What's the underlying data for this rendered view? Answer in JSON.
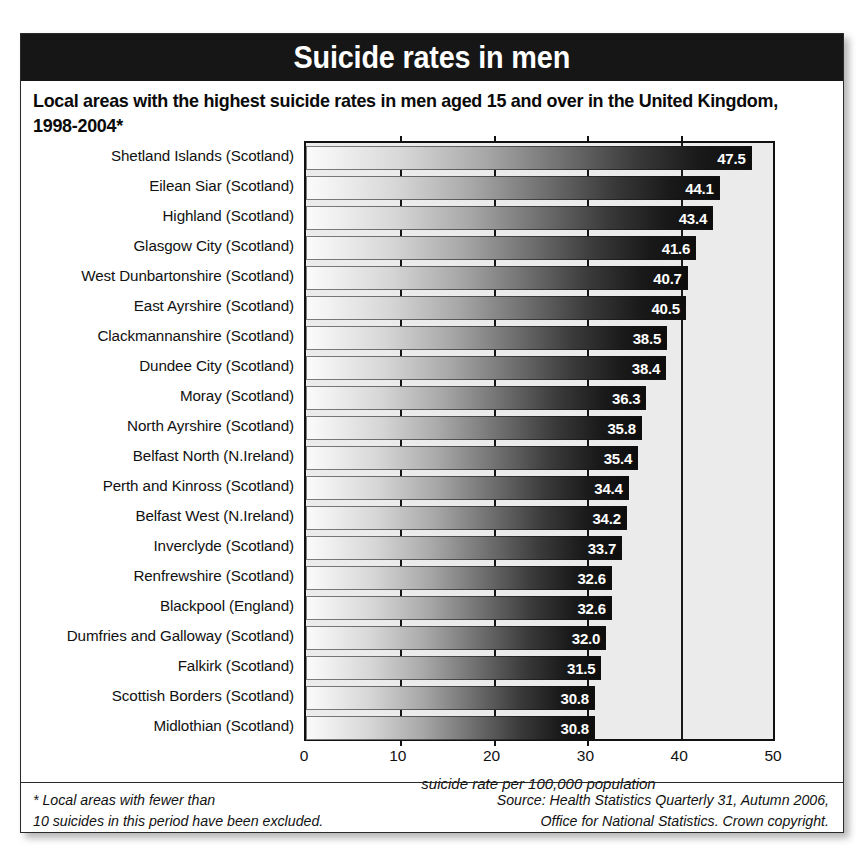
{
  "header": {
    "title": "Suicide rates in men",
    "subtitle": "Local areas with the highest suicide rates in men aged 15 and over in the United Kingdom, 1998-2004*"
  },
  "footer": {
    "footnote_line1": "* Local areas with fewer than",
    "footnote_line2": "10 suicides in this period have been excluded.",
    "source_line1": "Source: Health Statistics Quarterly 31, Autumn 2006,",
    "source_line2": "Office for National Statistics. Crown copyright."
  },
  "colors": {
    "title_bar": "#161616",
    "plot_background": "#ebebeb",
    "bar_dark": "#0d0d0d",
    "bar_light": "#fbfbfb",
    "axis": "#111111"
  },
  "chart_data": {
    "type": "bar",
    "orientation": "horizontal",
    "title": "Suicide rates in men",
    "subtitle": "Local areas with the highest suicide rates in men aged 15 and over in the United Kingdom, 1998-2004*",
    "xlabel": "suicide rate per 100,000 population",
    "ylabel": "",
    "xlim": [
      0,
      50
    ],
    "xticks": [
      0,
      10,
      20,
      30,
      40,
      50
    ],
    "grid": "vertical gridline at 40 and plot frame at 0 and 50; short tick stubs at 10, 20, 30",
    "legend": "none",
    "value_labels": true,
    "categories": [
      "Shetland Islands (Scotland)",
      "Eilean Siar (Scotland)",
      "Highland (Scotland)",
      "Glasgow City (Scotland)",
      "West Dunbartonshire (Scotland)",
      "East Ayrshire (Scotland)",
      "Clackmannanshire (Scotland)",
      "Dundee City (Scotland)",
      "Moray (Scotland)",
      "North Ayrshire (Scotland)",
      "Belfast North (N.Ireland)",
      "Perth and Kinross (Scotland)",
      "Belfast West (N.Ireland)",
      "Inverclyde (Scotland)",
      "Renfrewshire (Scotland)",
      "Blackpool (England)",
      "Dumfries and Galloway (Scotland)",
      "Falkirk (Scotland)",
      "Scottish Borders (Scotland)",
      "Midlothian (Scotland)"
    ],
    "values": [
      47.5,
      44.1,
      43.4,
      41.6,
      40.7,
      40.5,
      38.5,
      38.4,
      36.3,
      35.8,
      35.4,
      34.4,
      34.2,
      33.7,
      32.6,
      32.6,
      32.0,
      31.5,
      30.8,
      30.8
    ],
    "value_labels_text": [
      "47.5",
      "44.1",
      "43.4",
      "41.6",
      "40.7",
      "40.5",
      "38.5",
      "38.4",
      "36.3",
      "35.8",
      "35.4",
      "34.4",
      "34.2",
      "33.7",
      "32.6",
      "32.6",
      "32.0",
      "31.5",
      "30.8",
      "30.8"
    ]
  }
}
